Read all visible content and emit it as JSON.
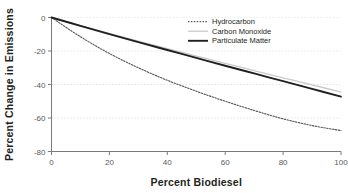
{
  "chart_data": {
    "type": "line",
    "title": "",
    "xlabel": "Percent Biodiesel",
    "ylabel": "Percent Change in Emissions",
    "xlim": [
      0,
      100
    ],
    "ylim": [
      -80,
      0
    ],
    "xticks": [
      0,
      20,
      40,
      60,
      80,
      100
    ],
    "yticks": [
      0,
      -20,
      -40,
      -60,
      -80
    ],
    "xtick_labels": [
      "0",
      "20",
      "40",
      "60",
      "80",
      "100"
    ],
    "ytick_labels": [
      "0",
      "-20",
      "-40",
      "-60",
      "-80"
    ],
    "grid": true,
    "grid_axis": "y",
    "legend_position": "top-right",
    "x": [
      0,
      10,
      20,
      30,
      40,
      50,
      60,
      70,
      80,
      90,
      100
    ],
    "series": [
      {
        "name": "Hydrocarbon",
        "style": "dotted",
        "color": "#555555",
        "values": [
          0,
          -11.5,
          -21.5,
          -30.0,
          -37.5,
          -44.0,
          -50.0,
          -55.5,
          -60.5,
          -64.5,
          -67.5
        ]
      },
      {
        "name": "Carbon Monoxide",
        "style": "solid-light",
        "color": "#c9c9c9",
        "values": [
          0,
          -4.8,
          -9.5,
          -14.1,
          -18.6,
          -23.0,
          -27.4,
          -31.7,
          -36.0,
          -40.2,
          -44.5
        ]
      },
      {
        "name": "Particulate Matter",
        "style": "solid",
        "color": "#231f20",
        "values": [
          0,
          -5.0,
          -9.9,
          -14.7,
          -19.4,
          -24.1,
          -28.8,
          -33.4,
          -38.0,
          -42.6,
          -47.2
        ]
      }
    ]
  },
  "legend": {
    "entries": [
      {
        "label": "Hydrocarbon"
      },
      {
        "label": "Carbon Monoxide"
      },
      {
        "label": "Particulate Matter"
      }
    ]
  },
  "axes": {
    "x_title": "Percent Biodiesel",
    "y_title": "Percent Change in Emissions"
  }
}
